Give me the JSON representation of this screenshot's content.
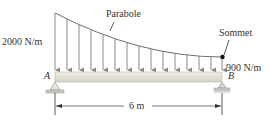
{
  "labels": {
    "left_load": "2000 N/m",
    "right_load": "900 N/m",
    "curve": "Parabole",
    "vertex": "Sommet",
    "support_a": "A",
    "support_b": "B",
    "span": "6 m"
  },
  "colors": {
    "line": "#8a8a8a",
    "beam_fill": "#e4e2da",
    "beam_edge": "#b9b6ab",
    "dot": "#111111",
    "text": "#333333"
  },
  "diagram": {
    "beam": {
      "x1": 55,
      "x2": 222,
      "y_top": 72,
      "y_bottom": 82
    },
    "load_curve": {
      "start": [
        55,
        13
      ],
      "vertex": [
        222,
        57
      ]
    },
    "arrow_count": 15
  }
}
